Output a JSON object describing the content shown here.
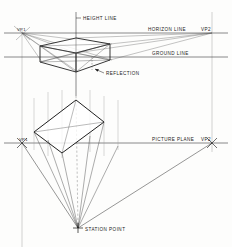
{
  "drawing": {
    "title": "Two-Point Perspective Construction",
    "background_color": "#fdfdfc",
    "ink_color": "#1b1b1b",
    "light_ink_color": "#6e6e6e"
  },
  "labels": {
    "height_line": "HEIGHT LINE",
    "horizon_line": "HORIZON LINE",
    "ground_line": "GROUND LINE",
    "picture_plane": "PICTURE PLANE",
    "reflection": "REFLECTION",
    "station_point": "STATION POINT",
    "vp1_top": "VP1",
    "vp2_top": "VP2",
    "vp1_plan": "VP1",
    "vp2_plan": "VP2"
  },
  "geometry": {
    "canvas": {
      "width": 232,
      "height": 247
    },
    "horizon_line": {
      "y": 33,
      "x1": 4,
      "x2": 228
    },
    "ground_line": {
      "y": 57,
      "x1": 4,
      "x2": 228
    },
    "picture_plane_line": {
      "y": 143,
      "x1": 4,
      "x2": 228
    },
    "height_line": {
      "x": 76,
      "y1": 12,
      "y2": 96
    },
    "vp1_top": {
      "x": 22,
      "y": 33
    },
    "vp2_top": {
      "x": 212,
      "y": 33
    },
    "vp1_plan": {
      "x": 22,
      "y": 143
    },
    "vp2_plan": {
      "x": 212,
      "y": 143
    },
    "station_point": {
      "x": 78,
      "y": 228
    },
    "vertical_trace_left": {
      "x": 22,
      "y1": 30,
      "y2": 247
    },
    "vertical_trace_right": {
      "x": 212,
      "y1": 12,
      "y2": 152
    },
    "box_top_face": [
      [
        40,
        46
      ],
      [
        76,
        38
      ],
      [
        110,
        44
      ],
      [
        76,
        53
      ]
    ],
    "box_front_left_bottom": [
      [
        40,
        46
      ],
      [
        40,
        62
      ]
    ],
    "box_front_mid_bottom": [
      [
        76,
        53
      ],
      [
        76,
        72
      ]
    ],
    "box_front_right_bottom": [
      [
        110,
        44
      ],
      [
        110,
        60
      ]
    ],
    "box_bottom_edges": [
      [
        40,
        62
      ],
      [
        76,
        72
      ],
      [
        110,
        60
      ]
    ],
    "plan_rect": [
      [
        34,
        132
      ],
      [
        76,
        100
      ],
      [
        104,
        122
      ],
      [
        62,
        153
      ]
    ],
    "sight_lines_count": 6
  }
}
